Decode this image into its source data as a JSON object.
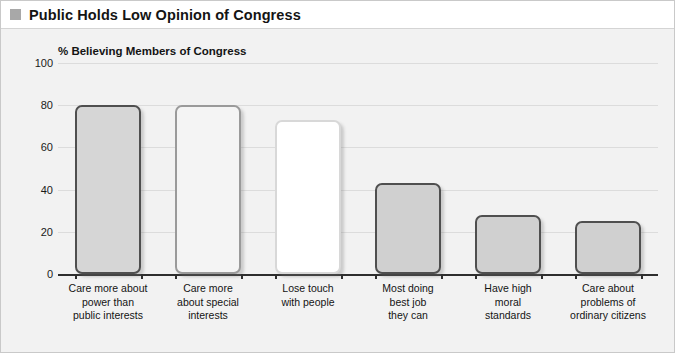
{
  "header": {
    "title": "Public Holds Low Opinion of Congress",
    "bullet_icon": "square-bullet-icon"
  },
  "chart_data": {
    "type": "bar",
    "title": "Public Holds Low Opinion of Congress",
    "subtitle": "% Believing Members of Congress",
    "xlabel": "",
    "ylabel": "",
    "ylim": [
      0,
      100
    ],
    "yticks": [
      100,
      80,
      60,
      40,
      20,
      0
    ],
    "ytick_labels": [
      "100",
      "80",
      "60",
      "40",
      "20",
      "0"
    ],
    "grid": true,
    "legend": null,
    "categories": [
      "Care more about power than public interests",
      "Care more about special interests",
      "Lose touch with people",
      "Most doing best job they can",
      "Have high moral standards",
      "Care about problems of ordinary citizens"
    ],
    "category_lines": [
      [
        "Care more about",
        "power than",
        "public interests"
      ],
      [
        "Care more",
        "about special",
        "interests"
      ],
      [
        "Lose touch",
        "with people"
      ],
      [
        "Most doing",
        "best job",
        "they can"
      ],
      [
        "Have high",
        "moral",
        "standards"
      ],
      [
        "Care about",
        "problems of",
        "ordinary citizens"
      ]
    ],
    "values": [
      80,
      80,
      73,
      43,
      28,
      25
    ],
    "bar_styles": [
      {
        "fill": "#d6d6d6",
        "border": "#4f4f4f"
      },
      {
        "fill": "#f4f4f4",
        "border": "#9a9a9a"
      },
      {
        "fill": "#ffffff",
        "border": "#d8d8d8"
      },
      {
        "fill": "#d0d0d0",
        "border": "#4f4f4f"
      },
      {
        "fill": "#d0d0d0",
        "border": "#4f4f4f"
      },
      {
        "fill": "#d0d0d0",
        "border": "#4f4f4f"
      }
    ]
  },
  "colors": {
    "background": "#f2f2f2",
    "title_band": "#ffffff",
    "grid": "#dcdcdc",
    "axis": "#2e2e2e",
    "text": "#141414",
    "bullet": "#a8a8a8"
  }
}
